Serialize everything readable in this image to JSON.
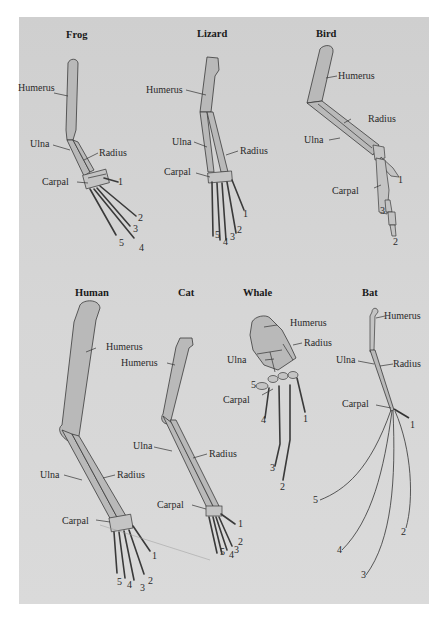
{
  "figure": {
    "panels": [
      {
        "id": "frog",
        "title": "Frog",
        "labels": {
          "humerus": "Humerus",
          "ulna": "Ulna",
          "radius": "Radius",
          "carpal": "Carpal"
        },
        "digits": [
          "1",
          "2",
          "3",
          "4",
          "5"
        ]
      },
      {
        "id": "lizard",
        "title": "Lizard",
        "labels": {
          "humerus": "Humerus",
          "ulna": "Ulna",
          "radius": "Radius",
          "carpal": "Carpal"
        },
        "digits": [
          "1",
          "2",
          "3",
          "4",
          "5"
        ]
      },
      {
        "id": "bird",
        "title": "Bird",
        "labels": {
          "humerus": "Humerus",
          "ulna": "Ulna",
          "radius": "Radius",
          "carpal": "Carpal"
        },
        "digits": [
          "1",
          "2",
          "3"
        ]
      },
      {
        "id": "human",
        "title": "Human",
        "labels": {
          "humerus": "Humerus",
          "ulna": "Ulna",
          "radius": "Radius",
          "carpal": "Carpal"
        },
        "digits": [
          "1",
          "2",
          "3",
          "4",
          "5"
        ]
      },
      {
        "id": "cat",
        "title": "Cat",
        "labels": {
          "humerus": "Humerus",
          "ulna": "Ulna",
          "radius": "Radius",
          "carpal": "Carpal"
        },
        "digits": [
          "1",
          "2",
          "3",
          "4",
          "5"
        ]
      },
      {
        "id": "whale",
        "title": "Whale",
        "labels": {
          "humerus": "Humerus",
          "ulna": "Ulna",
          "radius": "Radius",
          "carpal": "Carpal"
        },
        "digits": [
          "1",
          "2",
          "3",
          "4",
          "5"
        ]
      },
      {
        "id": "bat",
        "title": "Bat",
        "labels": {
          "humerus": "Humerus",
          "ulna": "Ulna",
          "radius": "Radius",
          "carpal": "Carpal"
        },
        "digits": [
          "1",
          "2",
          "3",
          "4",
          "5"
        ]
      }
    ]
  }
}
